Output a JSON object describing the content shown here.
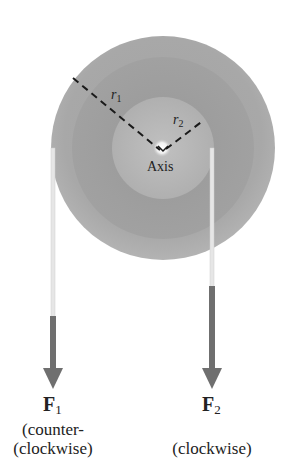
{
  "diagram": {
    "type": "pulley-torque",
    "colors": {
      "background": "#ffffff",
      "disk_outer": "#a9a9a9",
      "disk_middle": "#9d9d9d",
      "disk_inner": "#b4b4b4",
      "rope": "#e4e4e4",
      "arrow": "#6f6f6f",
      "dash": "#1a1a1a"
    },
    "axis": {
      "label": "Axis",
      "center_x": 163,
      "center_y": 148
    },
    "radii": [
      {
        "symbol": "r",
        "subscript": "1"
      },
      {
        "symbol": "r",
        "subscript": "2"
      }
    ],
    "forces": [
      {
        "symbol": "F",
        "subscript": "1",
        "description_line1": "(counter-",
        "description_line2": "(clockwise)"
      },
      {
        "symbol": "F",
        "subscript": "2",
        "description_line1": "",
        "description_line2": "(clockwise)"
      }
    ]
  }
}
